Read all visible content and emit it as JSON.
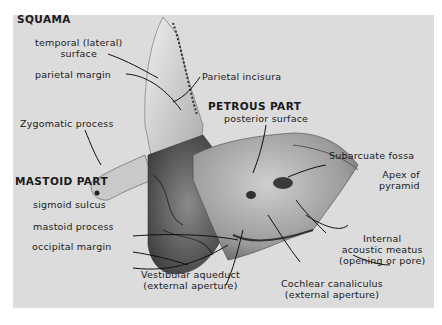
{
  "figure": {
    "colors": {
      "page_background": "#ffffff",
      "plate_background": "#dcdcdc",
      "text": "#1a1a1a"
    }
  },
  "sections": {
    "squama": "SQUAMA",
    "petrous": "PETROUS PART",
    "mastoid": "MASTOID PART"
  },
  "labels": {
    "temporal_surface_1": "temporal (lateral)",
    "temporal_surface_2": "surface",
    "parietal_margin": "parietal margin",
    "parietal_incisura": "Parietal incisura",
    "zygomatic_process": "Zygomatic process",
    "posterior_surface": "posterior surface",
    "subarcuate_fossa": "Subarcuate fossa",
    "apex_1": "Apex of",
    "apex_2": "pyramid",
    "sigmoid_sulcus": "sigmoid sulcus",
    "mastoid_process": "mastoid process",
    "occipital_margin": "occipital margin",
    "internal_meatus_1": "Internal",
    "internal_meatus_2": "acoustic meatus",
    "internal_meatus_3": "(opening or pore)",
    "cochlear_1": "Cochlear canaliculus",
    "cochlear_2": "(external aperture)",
    "vestibular_1": "Vestibular aqueduct",
    "vestibular_2": "(external aperture)"
  }
}
